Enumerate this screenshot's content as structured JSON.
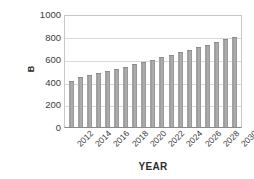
{
  "chart_data": {
    "type": "bar",
    "title": "",
    "xlabel": "YEAR",
    "ylabel": "B",
    "ylim": [
      0,
      1000
    ],
    "ytick_values": [
      1000,
      800,
      600,
      400,
      200,
      0
    ],
    "ytick_labels": [
      "1000",
      "800",
      "600",
      "400",
      "200",
      "0"
    ],
    "grid": true,
    "legend": "none",
    "categories": [
      "2012",
      "2013",
      "2014",
      "2015",
      "2016",
      "2017",
      "2018",
      "2019",
      "2020",
      "2021",
      "2022",
      "2023",
      "2024",
      "2025",
      "2026",
      "2027",
      "2028",
      "2029",
      "2030"
    ],
    "xtick_labels_shown": [
      "2012",
      "2014",
      "2016",
      "2018",
      "2020",
      "2022",
      "2024",
      "2026",
      "2028",
      "2030"
    ],
    "values": [
      415,
      447,
      462,
      480,
      503,
      518,
      540,
      560,
      577,
      596,
      623,
      640,
      667,
      685,
      710,
      732,
      755,
      782,
      800
    ],
    "bar_color": "#a6a6a6"
  }
}
